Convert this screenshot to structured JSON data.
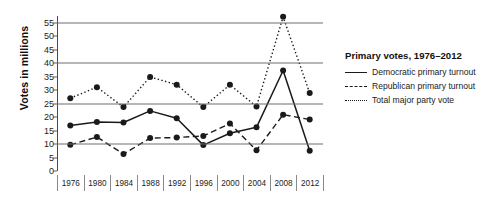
{
  "chart_data": {
    "type": "line",
    "title": "Primary votes, 1976–2012",
    "xlabel": "",
    "ylabel": "Votes in millions",
    "categories": [
      "1976",
      "1980",
      "1984",
      "1988",
      "1992",
      "1996",
      "2000",
      "2004",
      "2008",
      "2012"
    ],
    "ylim": [
      0,
      57.5
    ],
    "yticks": [
      0,
      5,
      10,
      15,
      20,
      25,
      30,
      35,
      40,
      45,
      50,
      55
    ],
    "gridlines": [
      10,
      25,
      40,
      55
    ],
    "grid": true,
    "legend_position": "right",
    "series": [
      {
        "name": "Democratic primary turnout",
        "style": "solid",
        "values": [
          16.9,
          18.2,
          18.0,
          22.3,
          19.6,
          9.6,
          14.0,
          16.2,
          37.3,
          7.5
        ]
      },
      {
        "name": "Republican primary turnout",
        "style": "dashed",
        "values": [
          9.7,
          12.6,
          6.3,
          12.2,
          12.4,
          13.0,
          17.6,
          7.7,
          20.9,
          19.1
        ]
      },
      {
        "name": "Total major party vote",
        "style": "dotted",
        "values": [
          27.0,
          31.1,
          23.7,
          34.9,
          32.0,
          23.7,
          32.0,
          23.9,
          57.2,
          28.9
        ]
      }
    ]
  },
  "axis": {
    "y_title": "Votes in millions"
  },
  "legend": {
    "title": "Primary votes, 1976–2012",
    "entries": [
      {
        "label": "Democratic primary turnout",
        "style": "solid"
      },
      {
        "label": "Republican primary turnout",
        "style": "dashed"
      },
      {
        "label": "Total major party vote",
        "style": "dotted"
      }
    ]
  },
  "colors": {
    "line": "#1a1a1a",
    "grid": "#6f6f6f",
    "axis": "#4a4a4a",
    "text": "#1b1b1b",
    "background": "#ffffff"
  }
}
